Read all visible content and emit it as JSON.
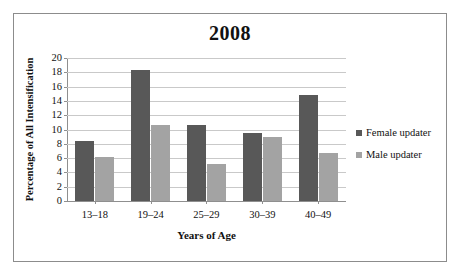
{
  "chart_data": {
    "type": "bar",
    "title": "2008",
    "xlabel": "Years of Age",
    "ylabel": "Percentage of All Intensification",
    "categories": [
      "13–18",
      "19–24",
      "25–29",
      "30–39",
      "40–49"
    ],
    "series": [
      {
        "name": "Female updater",
        "color": "#585858",
        "values": [
          8.4,
          18.3,
          10.6,
          9.5,
          14.8
        ]
      },
      {
        "name": "Male updater",
        "color": "#a3a3a3",
        "values": [
          6.2,
          10.6,
          5.2,
          8.9,
          6.7
        ]
      }
    ],
    "ylim": [
      0,
      20
    ],
    "ytick_step": 2,
    "yticks": [
      "20",
      "18",
      "16",
      "14",
      "12",
      "10",
      "8",
      "6",
      "4",
      "2",
      "0"
    ],
    "grid": true,
    "legend_position": "right"
  },
  "legend": {
    "items": [
      {
        "label": "Female updater",
        "marker": "square-dark"
      },
      {
        "label": "Male updater",
        "marker": "square-light"
      }
    ]
  },
  "colors": {
    "female_bar": "#585858",
    "male_bar": "#a3a3a3",
    "gridline": "#c9c9c9",
    "axis": "#8f8f8f",
    "border": "#8c8c8c",
    "background": "#ffffff"
  }
}
